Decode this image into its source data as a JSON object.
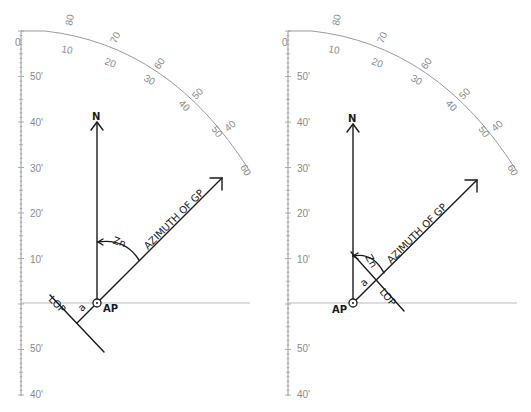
{
  "figure": {
    "panels": [
      {
        "id": "left",
        "offset_x": 0,
        "scale_labels_left": [
          "0",
          "50'",
          "40'",
          "30'",
          "20'",
          "10'",
          "50'",
          "40'"
        ],
        "arc_labels_outer": [
          "80",
          "70",
          "60",
          "50",
          "40"
        ],
        "arc_labels_inner": [
          "10",
          "20",
          "30",
          "40",
          "50",
          "60"
        ],
        "north_label": "N",
        "azimuth_label": "AZIMUTH OF GP",
        "zn_label": "Zn",
        "intercept_label": "a",
        "lop_label": "LOP",
        "ap_label": "AP",
        "intercept_direction": "away"
      },
      {
        "id": "right",
        "offset_x": 265,
        "scale_labels_left": [
          "0",
          "50'",
          "40'",
          "30'",
          "20'",
          "10'",
          "50'",
          "40'"
        ],
        "arc_labels_outer": [
          "80",
          "70",
          "60",
          "50",
          "40"
        ],
        "arc_labels_inner": [
          "10",
          "20",
          "30",
          "40",
          "50",
          "60"
        ],
        "north_label": "N",
        "azimuth_label": "AZIMUTH OF GP",
        "zn_label": "Zn",
        "intercept_label": "a",
        "lop_label": "LOP",
        "ap_label": "AP",
        "intercept_direction": "toward"
      }
    ],
    "colors": {
      "ink": "#1a1a1a",
      "scale": "#9a9a9a",
      "baseline": "#b5b5b5"
    }
  }
}
